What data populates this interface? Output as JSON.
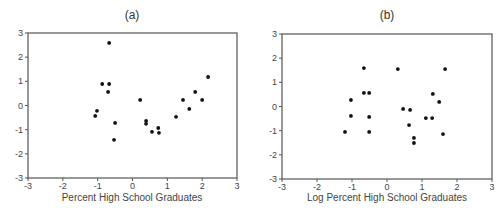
{
  "chart_data": [
    {
      "type": "scatter",
      "panel": "a",
      "title": "(a)",
      "xlabel": "Percent High School Graduates",
      "ylabel": "",
      "xlim": [
        -3,
        3
      ],
      "ylim": [
        -3,
        3
      ],
      "xticks": [
        -3,
        -2,
        -1,
        0,
        1,
        2,
        3
      ],
      "yticks": [
        3,
        2,
        1,
        0,
        -1,
        -2,
        -3
      ],
      "grid": false,
      "points": [
        {
          "x": -0.67,
          "y": 2.59
        },
        {
          "x": -0.87,
          "y": 0.89
        },
        {
          "x": -0.67,
          "y": 0.89
        },
        {
          "x": -0.7,
          "y": 0.56
        },
        {
          "x": -1.02,
          "y": -0.22
        },
        {
          "x": -1.07,
          "y": -0.43
        },
        {
          "x": -0.5,
          "y": -0.72
        },
        {
          "x": -0.53,
          "y": -1.42
        },
        {
          "x": 0.22,
          "y": 0.23
        },
        {
          "x": 0.39,
          "y": -0.64
        },
        {
          "x": 0.39,
          "y": -0.76
        },
        {
          "x": 0.56,
          "y": -1.09
        },
        {
          "x": 0.74,
          "y": -0.93
        },
        {
          "x": 0.76,
          "y": -1.13
        },
        {
          "x": 1.25,
          "y": -0.47
        },
        {
          "x": 1.45,
          "y": 0.23
        },
        {
          "x": 1.63,
          "y": -0.14
        },
        {
          "x": 1.8,
          "y": 0.56
        },
        {
          "x": 2.0,
          "y": 0.23
        },
        {
          "x": 2.17,
          "y": 1.18
        }
      ]
    },
    {
      "type": "scatter",
      "panel": "b",
      "title": "(b)",
      "xlabel": "Log Percent High School Graduates",
      "ylabel": "",
      "xlim": [
        -3,
        3
      ],
      "ylim": [
        -3,
        3
      ],
      "xticks": [
        -3,
        -2,
        -1,
        0,
        1,
        2,
        3
      ],
      "yticks": [
        3,
        2,
        1,
        0,
        -1,
        -2,
        -3
      ],
      "grid": false,
      "points": [
        {
          "x": -0.66,
          "y": 1.59
        },
        {
          "x": -0.66,
          "y": 0.56
        },
        {
          "x": -0.51,
          "y": 0.56
        },
        {
          "x": -1.03,
          "y": 0.27
        },
        {
          "x": -1.03,
          "y": -0.39
        },
        {
          "x": -0.51,
          "y": -0.43
        },
        {
          "x": -1.2,
          "y": -1.05
        },
        {
          "x": -0.51,
          "y": -1.05
        },
        {
          "x": 0.31,
          "y": 1.55
        },
        {
          "x": 1.66,
          "y": 1.55
        },
        {
          "x": 1.31,
          "y": 0.52
        },
        {
          "x": 1.49,
          "y": 0.19
        },
        {
          "x": 0.46,
          "y": -0.1
        },
        {
          "x": 0.66,
          "y": -0.14
        },
        {
          "x": 1.11,
          "y": -0.48
        },
        {
          "x": 1.29,
          "y": -0.48
        },
        {
          "x": 0.63,
          "y": -0.77
        },
        {
          "x": 1.6,
          "y": -1.14
        },
        {
          "x": 0.77,
          "y": -1.3
        },
        {
          "x": 0.77,
          "y": -1.51
        }
      ]
    }
  ],
  "panels": {
    "a": {
      "title": "(a)",
      "xlabel": "Percent High School Graduates"
    },
    "b": {
      "title": "(b)",
      "xlabel": "Log Percent High School Graduates"
    }
  },
  "style": {
    "axis_color": "#555555",
    "point_color": "#111111"
  }
}
